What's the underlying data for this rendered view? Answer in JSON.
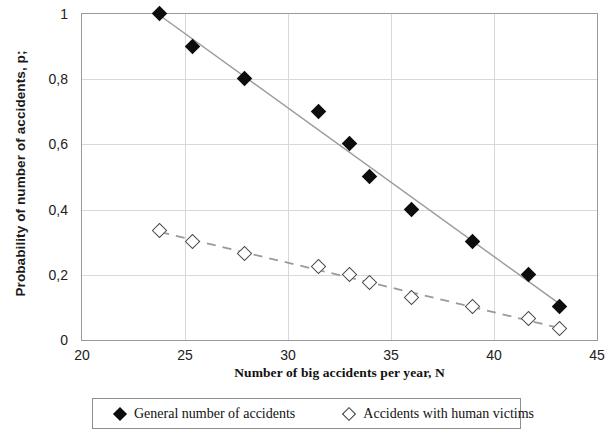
{
  "chart_data": {
    "type": "scatter",
    "title": "",
    "xlabel": "Number of big accidents per year, N",
    "ylabel": "Probability of number of accidents, p;",
    "xlim": [
      20,
      45
    ],
    "ylim": [
      0,
      1
    ],
    "xticks": [
      "20",
      "25",
      "30",
      "35",
      "40",
      "45"
    ],
    "xtick_values": [
      20,
      25,
      30,
      35,
      40,
      45
    ],
    "yticks": [
      "0",
      "0,2",
      "0,4",
      "0,6",
      "0,8",
      "1"
    ],
    "ytick_values": [
      0,
      0.2,
      0.4,
      0.6,
      0.8,
      1
    ],
    "grid": true,
    "legend_position": "below",
    "decimal_separator": ",",
    "series": [
      {
        "name": "General number of accidents",
        "marker": "filled-diamond",
        "marker_color": "#0d0d0d",
        "trendline": "solid",
        "trendline_color": "#9a9a9a",
        "x": [
          23.8,
          25.4,
          27.9,
          31.5,
          33.0,
          34.0,
          36.0,
          39.0,
          41.7,
          43.2
        ],
        "y": [
          1.0,
          0.9,
          0.8,
          0.7,
          0.6,
          0.5,
          0.4,
          0.3,
          0.2,
          0.1
        ]
      },
      {
        "name": "Accidents with human victims",
        "marker": "hollow-diamond",
        "marker_color": "#4d4d4d",
        "trendline": "dashed",
        "trendline_color": "#9a9a9a",
        "x": [
          23.8,
          25.4,
          27.9,
          31.5,
          33.0,
          34.0,
          36.0,
          39.0,
          41.7,
          43.2
        ],
        "y": [
          0.335,
          0.3,
          0.265,
          0.225,
          0.2,
          0.175,
          0.13,
          0.1,
          0.065,
          0.035
        ]
      }
    ]
  },
  "legend": {
    "items": [
      {
        "label": "General number of accidents",
        "marker": "filled-diamond"
      },
      {
        "label": "Accidents with human victims",
        "marker": "hollow-diamond"
      }
    ]
  }
}
